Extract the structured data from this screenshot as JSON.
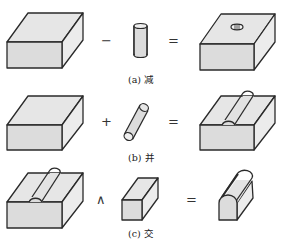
{
  "figure": {
    "rows": [
      {
        "id": "a",
        "operator": "−",
        "equals": "=",
        "caption": "(a) 减",
        "operation": "subtraction",
        "operands": [
          "rectangular-block",
          "vertical-cylinder"
        ],
        "result": "block-with-hole"
      },
      {
        "id": "b",
        "operator": "+",
        "equals": "=",
        "caption": "(b) 并",
        "operation": "union",
        "operands": [
          "rectangular-block",
          "diagonal-cylinder-rod"
        ],
        "result": "block-with-embedded-rod"
      },
      {
        "id": "c",
        "operator": "∧",
        "equals": "=",
        "caption": "(c) 交",
        "operation": "intersection",
        "operands": [
          "block-with-embedded-rod",
          "narrow-box"
        ],
        "result": "narrow-box-with-rounded-top"
      }
    ],
    "colors": {
      "fill_light": "#e6e6e6",
      "fill_front": "#dcdcdc",
      "stroke": "#2a2a2a",
      "background": "#ffffff"
    }
  }
}
